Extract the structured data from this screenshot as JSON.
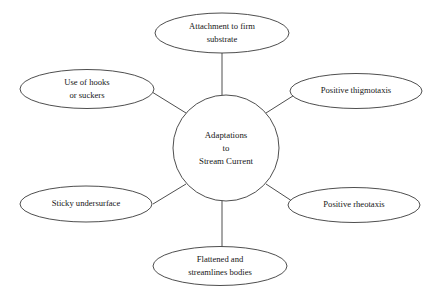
{
  "diagram": {
    "type": "spider-concept-map",
    "background_color": "#ffffff",
    "stroke_color": "#3a3a3a",
    "text_color": "#161616",
    "hub": {
      "name": "adaptations-to-stream-current",
      "shape": "circle",
      "line1": "Adaptations",
      "line2": "to",
      "line3": "Stream Current"
    },
    "nodes": [
      {
        "id": "attachment",
        "position": "top",
        "shape": "ellipse",
        "line1": "Attachment to firm",
        "line2": "substrate"
      },
      {
        "id": "hooks",
        "position": "upper-left",
        "shape": "ellipse",
        "line1": "Use of hooks",
        "line2": "or suckers"
      },
      {
        "id": "thigmotaxis",
        "position": "upper-right",
        "shape": "ellipse",
        "line1": "Positive thigmotaxis",
        "line2": ""
      },
      {
        "id": "sticky",
        "position": "lower-left",
        "shape": "ellipse",
        "line1": "Sticky undersurface",
        "line2": ""
      },
      {
        "id": "rheotaxis",
        "position": "lower-right",
        "shape": "ellipse",
        "line1": "Positive rheotaxis",
        "line2": ""
      },
      {
        "id": "flattened",
        "position": "bottom",
        "shape": "ellipse",
        "line1": "Flattened and",
        "line2": "streamlines bodies"
      }
    ]
  }
}
